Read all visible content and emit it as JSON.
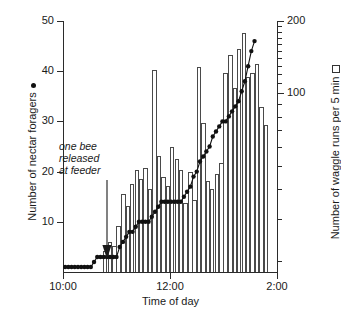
{
  "chart_data": {
    "type": "bar",
    "title": "",
    "xlabel": "Time of day",
    "ylabel": "Number of nectar foragers",
    "y2label": "Number of waggle runs per 5 min",
    "grid": false,
    "legend_position": "axis-titles",
    "x_axis": {
      "label": "Time of day",
      "ticks": [
        "10:00",
        "12:00",
        "2:00"
      ],
      "tick_values": [
        10.0,
        12.0,
        14.0
      ],
      "xlim": [
        10.0,
        14.0
      ]
    },
    "y_left": {
      "label": "Number of nectar foragers",
      "marker": "filled-circle",
      "scale": "linear",
      "ylim": [
        0,
        50
      ],
      "ticks": [
        10,
        20,
        30,
        40,
        50
      ],
      "tick_labels": [
        "10",
        "20",
        "30",
        "40",
        "50"
      ]
    },
    "y_right": {
      "label": "Number of waggle runs per 5 min",
      "marker": "open-square",
      "scale": "log",
      "ylim": [
        18,
        200
      ],
      "major_ticks": [
        100,
        200
      ],
      "major_tick_labels": [
        "100",
        "200"
      ],
      "minor_ticks": [
        20,
        30,
        40,
        50,
        60,
        70,
        80,
        90,
        110,
        120,
        130,
        140,
        150,
        160,
        170,
        180,
        190
      ]
    },
    "annotations": [
      {
        "text_lines": [
          "one bee",
          "released",
          "at feeder"
        ],
        "style": "italic",
        "arrow": "down",
        "x_value": 10.83
      }
    ],
    "series": [
      {
        "name": "Number of waggle runs per 5 min",
        "type": "bar",
        "axis": "right",
        "bin_width_hours": 0.0833,
        "x": [
          10.04,
          10.13,
          10.21,
          10.29,
          10.38,
          10.46,
          10.54,
          10.63,
          10.71,
          10.79,
          10.88,
          10.96,
          11.04,
          11.13,
          11.21,
          11.29,
          11.38,
          11.46,
          11.54,
          11.63,
          11.71,
          11.79,
          11.88,
          11.96,
          12.04,
          12.13,
          12.21,
          12.29,
          12.38,
          12.46,
          12.54,
          12.63,
          12.71,
          12.79,
          12.88,
          12.96,
          13.04,
          13.13,
          13.21,
          13.29,
          13.38,
          13.46,
          13.54,
          13.63,
          13.71,
          13.79
        ],
        "values": [
          0,
          0,
          0,
          0,
          0,
          0,
          0,
          0,
          0,
          22,
          24,
          23,
          28,
          38,
          34,
          42,
          48,
          44,
          49,
          40,
          125,
          55,
          45,
          41,
          60,
          53,
          48,
          35,
          47,
          36,
          129,
          75,
          43,
          40,
          46,
          51,
          122,
          145,
          105,
          153,
          178,
          117,
          121,
          133,
          88,
          74
        ]
      },
      {
        "name": "Number of nectar foragers",
        "type": "line",
        "axis": "left",
        "marker": "filled-circle",
        "x": [
          10.04,
          10.1,
          10.16,
          10.22,
          10.28,
          10.34,
          10.4,
          10.46,
          10.52,
          10.58,
          10.64,
          10.7,
          10.76,
          10.82,
          10.88,
          10.94,
          11.0,
          11.06,
          11.12,
          11.18,
          11.24,
          11.3,
          11.36,
          11.42,
          11.48,
          11.54,
          11.6,
          11.66,
          11.72,
          11.78,
          11.84,
          11.9,
          11.96,
          12.02,
          12.08,
          12.14,
          12.2,
          12.26,
          12.32,
          12.38,
          12.44,
          12.5,
          12.56,
          12.62,
          12.68,
          12.74,
          12.8,
          12.86,
          12.92,
          12.98,
          13.04,
          13.1,
          13.16,
          13.22,
          13.28,
          13.34,
          13.4,
          13.46,
          13.52,
          13.58
        ],
        "values": [
          1,
          1,
          1,
          1,
          1,
          1,
          1,
          1,
          1,
          2,
          3,
          3,
          3,
          3,
          3,
          3,
          3,
          5,
          6,
          7,
          8,
          8,
          9,
          10,
          10,
          10,
          10,
          11,
          12,
          13,
          14,
          14,
          14,
          14,
          14,
          14,
          14,
          15,
          16,
          17,
          19,
          20,
          22,
          23,
          24,
          25,
          27,
          28,
          29,
          30,
          30,
          31,
          32,
          33,
          34,
          36,
          38,
          41,
          44,
          46
        ]
      }
    ]
  },
  "axis_titles": {
    "left": "Number of nectar foragers",
    "right": "Number of waggle runs per 5 min",
    "bottom": "Time of day"
  },
  "annotation": {
    "line1": "one bee",
    "line2": "released",
    "line3": "at feeder"
  },
  "ticks": {
    "left": [
      "50",
      "40",
      "30",
      "20",
      "10"
    ],
    "right": [
      "200",
      "100"
    ],
    "x": [
      "10:00",
      "12:00",
      "2:00"
    ]
  }
}
